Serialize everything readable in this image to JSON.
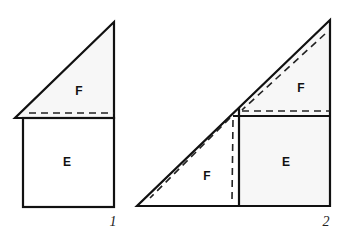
{
  "figures": [
    {
      "id": "figure-1",
      "number_label": "1",
      "regions": [
        {
          "label": "F",
          "shape": "right-triangle"
        },
        {
          "label": "E",
          "shape": "square"
        }
      ]
    },
    {
      "id": "figure-2",
      "number_label": "2",
      "regions": [
        {
          "label": "F",
          "shape": "right-triangle",
          "position": "top-right"
        },
        {
          "label": "E",
          "shape": "square",
          "position": "bottom-right"
        },
        {
          "label": "F",
          "shape": "right-triangle",
          "position": "bottom-left"
        }
      ]
    }
  ],
  "colors": {
    "stroke": "#111111",
    "background": "#ffffff"
  }
}
